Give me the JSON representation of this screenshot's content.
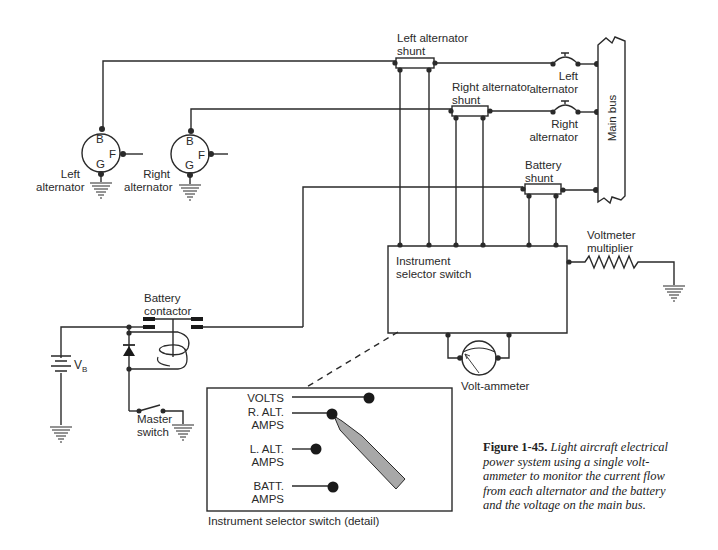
{
  "figure": {
    "number": "Figure 1-45.",
    "caption": "Light aircraft electrical power system using a single volt-ammeter to monitor the current flow from each alternator and the battery and the voltage on the main bus."
  },
  "components": {
    "left_alternator": {
      "label_line1": "Left",
      "label_line2": "alternator",
      "terminals": [
        "B",
        "F",
        "G"
      ]
    },
    "right_alternator": {
      "label_line1": "Right",
      "label_line2": "alternator",
      "terminals": [
        "B",
        "F",
        "G"
      ]
    },
    "left_alternator_shunt": {
      "label_line1": "Left alternator",
      "label_line2": "shunt"
    },
    "right_alternator_shunt": {
      "label_line1": "Right alternator",
      "label_line2": "shunt"
    },
    "battery_shunt": {
      "label_line1": "Battery",
      "label_line2": "shunt"
    },
    "left_alternator_breaker": {
      "label_line1": "Left",
      "label_line2": "alternator"
    },
    "right_alternator_breaker": {
      "label_line1": "Right",
      "label_line2": "alternator"
    },
    "main_bus": {
      "label": "Main bus"
    },
    "instrument_selector_switch": {
      "label_line1": "Instrument",
      "label_line2": "selector switch"
    },
    "voltmeter_multiplier": {
      "label_line1": "Voltmeter",
      "label_line2": "multiplier"
    },
    "volt_ammeter": {
      "label": "Volt-ammeter"
    },
    "battery_contactor": {
      "label_line1": "Battery",
      "label_line2": "contactor"
    },
    "battery": {
      "label": "V",
      "subscript": "B"
    },
    "master_switch": {
      "label_line1": "Master",
      "label_line2": "switch"
    }
  },
  "selector_detail": {
    "title": "Instrument selector switch (detail)",
    "positions": [
      {
        "line1": "VOLTS",
        "line2": ""
      },
      {
        "line1": "R. ALT.",
        "line2": "AMPS"
      },
      {
        "line1": "L. ALT.",
        "line2": "AMPS"
      },
      {
        "line1": "BATT.",
        "line2": "AMPS"
      }
    ],
    "selected_position": "R. ALT. AMPS",
    "pointer_color": "#a8a8a8"
  },
  "colors": {
    "line": "#2a2a2a",
    "background": "#ffffff"
  }
}
